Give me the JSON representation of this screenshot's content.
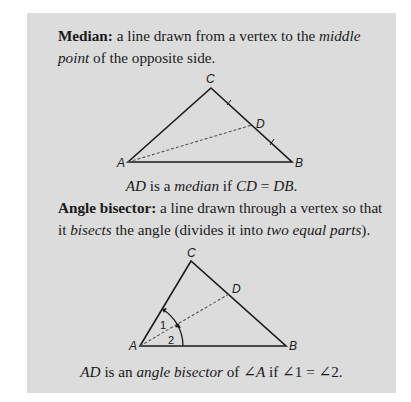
{
  "median": {
    "term": "Median:",
    "def_part1": " a line drawn from a vertex to the ",
    "def_italic1": "middle",
    "def_line2_italic": "point",
    "def_line2_rest": " of the opposite side.",
    "figure": {
      "vertices": {
        "A": "A",
        "B": "B",
        "C": "C",
        "D": "D"
      }
    },
    "caption": {
      "seg1_italic": "AD",
      "seg2": " is a ",
      "seg3_italic": "median",
      "seg4": " if ",
      "seg5_italic": "CD",
      "seg6": " = ",
      "seg7_italic": "DB",
      "seg8": "."
    }
  },
  "bisector": {
    "term": "Angle bisector:",
    "def_part1": " a line drawn through a vertex so that",
    "def_line2_a": "it ",
    "def_line2_italic1": "bisects",
    "def_line2_b": " the angle (divides it into ",
    "def_line2_italic2": "two equal parts",
    "def_line2_c": ").",
    "figure": {
      "vertices": {
        "A": "A",
        "B": "B",
        "C": "C",
        "D": "D"
      },
      "angle_labels": {
        "one": "1",
        "two": "2"
      }
    },
    "caption": {
      "seg1_italic": "AD",
      "seg2": " is an ",
      "seg3_italic": "angle bisector",
      "seg4": " of ∠",
      "seg5_italic": "A",
      "seg6": " if ∠1 = ∠2."
    }
  }
}
